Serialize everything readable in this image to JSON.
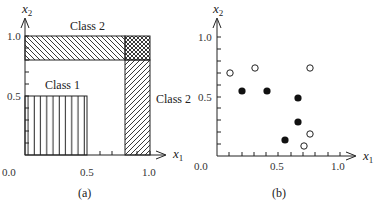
{
  "panel_a": {
    "caption": "(a)",
    "x_axis_label": "x",
    "x_axis_sub": "1",
    "y_axis_label": "x",
    "y_axis_sub": "2",
    "ticks": {
      "origin": "0.0",
      "x_half": "0.5",
      "x_one": "1.0",
      "y_half": "0.5",
      "y_one": "1.0"
    },
    "regions": {
      "class1_label": "Class 1",
      "class2_top_label": "Class 2",
      "class2_right_label": "Class 2"
    }
  },
  "panel_b": {
    "caption": "(b)",
    "x_axis_label": "x",
    "x_axis_sub": "1",
    "y_axis_label": "x",
    "y_axis_sub": "2",
    "ticks": {
      "origin": "0.0",
      "x_half": "0.5",
      "x_one": "1.0",
      "y_half": "0.5",
      "y_one": "1.0"
    }
  },
  "diagram": {
    "panel_a_regions": [
      {
        "name": "Class 1",
        "x": [
          0.0,
          0.5
        ],
        "y": [
          0.0,
          0.5
        ],
        "hatch": "vertical"
      },
      {
        "name": "Class 2",
        "x": [
          0.0,
          1.0
        ],
        "y": [
          0.8,
          1.0
        ],
        "hatch": "backslash"
      },
      {
        "name": "Class 2",
        "x": [
          0.8,
          1.0
        ],
        "y": [
          0.0,
          1.0
        ],
        "hatch": "slash"
      },
      {
        "name": "overlap",
        "x": [
          0.8,
          1.0
        ],
        "y": [
          0.8,
          1.0
        ],
        "hatch": "crosshatch"
      }
    ],
    "panel_b_points": {
      "open": [
        [
          0.12,
          0.7
        ],
        [
          0.31,
          0.74
        ],
        [
          0.76,
          0.74
        ],
        [
          0.76,
          0.18
        ],
        [
          0.71,
          0.08
        ]
      ],
      "filled": [
        [
          0.21,
          0.54
        ],
        [
          0.41,
          0.54
        ],
        [
          0.66,
          0.48
        ],
        [
          0.66,
          0.28
        ],
        [
          0.56,
          0.13
        ]
      ]
    }
  }
}
